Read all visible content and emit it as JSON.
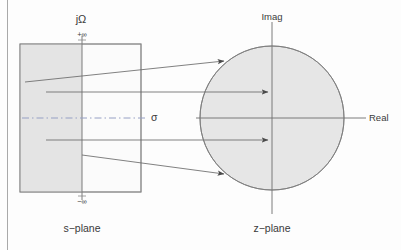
{
  "figure": {
    "colors": {
      "stroke": "#555555",
      "shade_fill": "#e4e4e4",
      "circle_fill": "#e6e6e6",
      "axis": "#6d6d6d",
      "dashed": "#9aa3c0",
      "text": "#3a3a3a",
      "page_rule": "#9f9f9f",
      "background": "#fdfdfd"
    },
    "left_panel": {
      "name": "s-plane",
      "caption": "s−plane",
      "axis_label_vertical": "jΩ",
      "axis_label_horizontal": "σ",
      "top_limit": "+∞",
      "bottom_limit": "−∞",
      "rect": {
        "x": 20,
        "y": 44,
        "width": 121,
        "height": 148
      },
      "shaded_region": {
        "x": 20,
        "y": 44,
        "width": 62,
        "height": 148
      },
      "vertical_axis_x": 82,
      "horizontal_axis_y": 118
    },
    "right_panel": {
      "name": "z-plane",
      "caption": "z−plane",
      "axis_label_vertical": "Imag",
      "axis_label_horizontal": "Real",
      "circle": {
        "cx": 272,
        "cy": 118,
        "r": 72
      },
      "vertical_axis_x": 272,
      "horizontal_axis_y": 118
    },
    "mapping_arrows": [
      {
        "name": "upper-edge-to-upper-left-arc",
        "x1": 90,
        "y1": 72,
        "x2": 226,
        "y2": 62
      },
      {
        "name": "upper-interior-to-center",
        "x1": 46,
        "y1": 92,
        "x2": 270,
        "y2": 92
      },
      {
        "name": "lower-interior-to-center",
        "x1": 46,
        "y1": 140,
        "x2": 270,
        "y2": 140
      },
      {
        "name": "lower-edge-to-lower-left-arc",
        "x1": 90,
        "y1": 160,
        "x2": 226,
        "y2": 174
      }
    ],
    "dashed_line": {
      "x1": 22,
      "y1": 118,
      "x2": 148,
      "y2": 118
    },
    "page_rule_x": 7
  }
}
